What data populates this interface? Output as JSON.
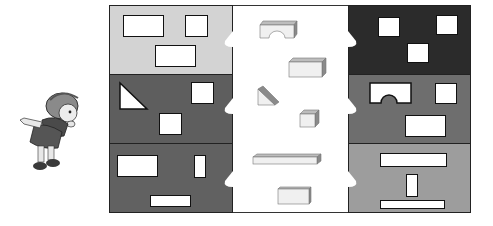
{
  "puzzle": {
    "description": "Match each 3D block to the wall opening it fits through",
    "colors": {
      "left_row1": "#d3d3d3",
      "left_row2": "#5e5e5e",
      "left_row3": "#616161",
      "right_row1": "#2b2b2b",
      "right_row2": "#6e6e6e",
      "right_row3": "#9d9d9d",
      "hole": "#ffffff",
      "block_face": "#f0f0f0",
      "block_top": "#bdbdbd",
      "block_side": "#8a8a8a"
    },
    "left_walls": [
      {
        "holes": [
          "wide-rectangle",
          "square",
          "wide-rectangle"
        ]
      },
      {
        "holes": [
          "triangle",
          "square",
          "square"
        ]
      },
      {
        "holes": [
          "wide-rectangle",
          "tall-rectangle",
          "thin-bar"
        ]
      }
    ],
    "right_walls": [
      {
        "holes": [
          "square",
          "square",
          "square"
        ]
      },
      {
        "holes": [
          "arch",
          "square",
          "wide-rectangle"
        ]
      },
      {
        "holes": [
          "long-bar",
          "tall-rectangle",
          "thin-bar"
        ]
      }
    ],
    "blocks": [
      "arch-block",
      "rectangular-block",
      "triangular-prism",
      "cube",
      "long-plank",
      "flat-block"
    ],
    "character": "cartoon-girl"
  }
}
